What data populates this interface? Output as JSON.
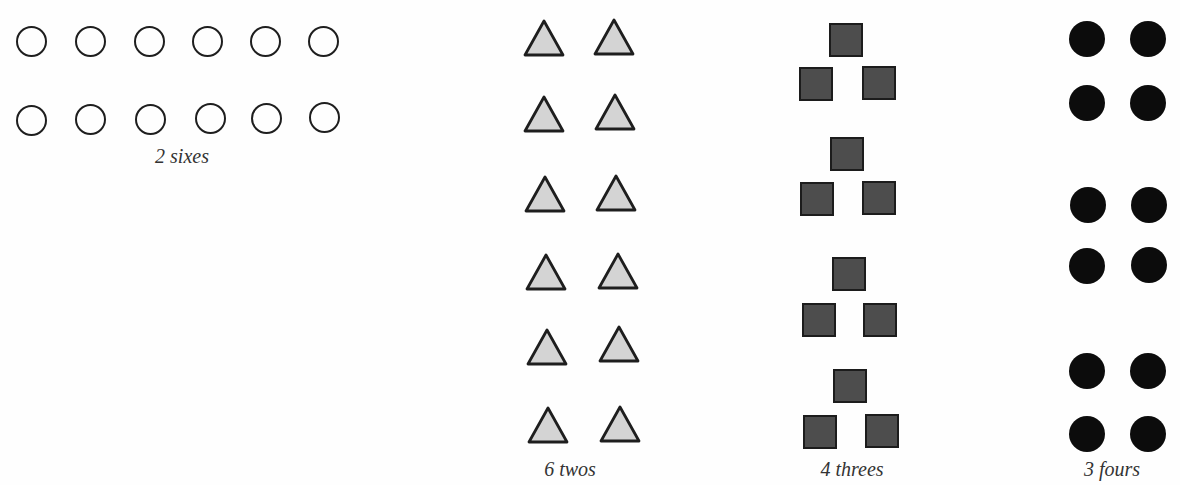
{
  "groups": [
    {
      "id": "sixes",
      "label": "2 sixes",
      "count": 2,
      "group_size": 6,
      "shape": "open-circle",
      "color": "#1e1e1e"
    },
    {
      "id": "twos",
      "label": "6 twos",
      "count": 6,
      "group_size": 2,
      "shape": "triangle",
      "fill": "#d4d4d4",
      "stroke": "#1e1e1e"
    },
    {
      "id": "threes",
      "label": "4 threes",
      "count": 4,
      "group_size": 3,
      "shape": "square",
      "fill": "#4d4d4d",
      "stroke": "#1c1c1c"
    },
    {
      "id": "fours",
      "label": "3 fours",
      "count": 3,
      "group_size": 4,
      "shape": "filled-circle",
      "color": "#0c0c0c"
    }
  ]
}
